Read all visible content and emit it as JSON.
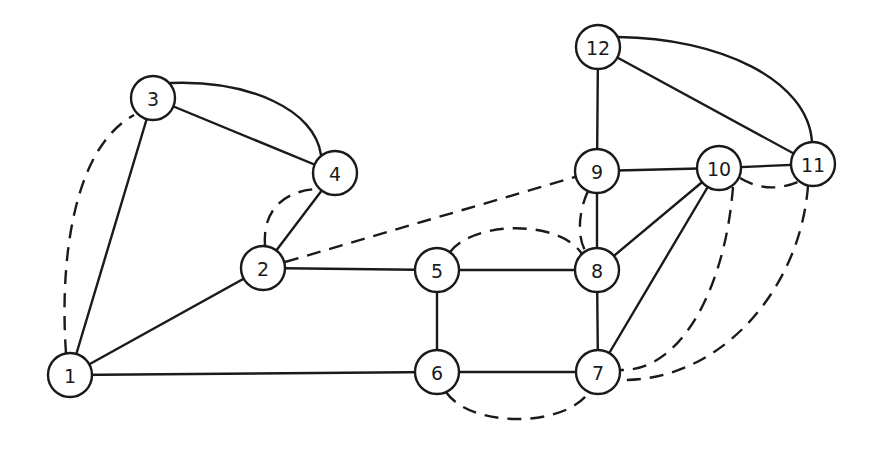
{
  "diagram": {
    "type": "undirected-graph",
    "colors": {
      "stroke": "#1a1a1a",
      "background": "#ffffff",
      "node_fill": "#ffffff"
    },
    "node_radius": 22,
    "nodes": [
      {
        "id": "1",
        "label": "1",
        "x": 70,
        "y": 375
      },
      {
        "id": "2",
        "label": "2",
        "x": 263,
        "y": 268
      },
      {
        "id": "3",
        "label": "3",
        "x": 153,
        "y": 98
      },
      {
        "id": "4",
        "label": "4",
        "x": 335,
        "y": 173
      },
      {
        "id": "5",
        "label": "5",
        "x": 437,
        "y": 270
      },
      {
        "id": "6",
        "label": "6",
        "x": 437,
        "y": 372
      },
      {
        "id": "7",
        "label": "7",
        "x": 598,
        "y": 372
      },
      {
        "id": "8",
        "label": "8",
        "x": 597,
        "y": 270
      },
      {
        "id": "9",
        "label": "9",
        "x": 597,
        "y": 171
      },
      {
        "id": "10",
        "label": "10",
        "x": 719,
        "y": 168
      },
      {
        "id": "11",
        "label": "11",
        "x": 813,
        "y": 164
      },
      {
        "id": "12",
        "label": "12",
        "x": 598,
        "y": 47
      }
    ],
    "edges": [
      {
        "from": "1",
        "to": "3",
        "style": "solid",
        "path": "M70,375 L153,98"
      },
      {
        "from": "1",
        "to": "2",
        "style": "solid",
        "path": "M70,375 L263,268"
      },
      {
        "from": "1",
        "to": "6",
        "style": "solid",
        "path": "M70,375 L437,372"
      },
      {
        "from": "3",
        "to": "4",
        "style": "solid",
        "path": "M153,98 L335,173"
      },
      {
        "from": "3",
        "to": "4",
        "style": "solid",
        "path": "M170,83 C250,80 315,110 321,155"
      },
      {
        "from": "2",
        "to": "4",
        "style": "solid",
        "path": "M263,268 L335,173"
      },
      {
        "from": "2",
        "to": "5",
        "style": "solid",
        "path": "M263,268 L437,270"
      },
      {
        "from": "5",
        "to": "8",
        "style": "solid",
        "path": "M437,270 L597,270"
      },
      {
        "from": "5",
        "to": "6",
        "style": "solid",
        "path": "M437,270 L437,372"
      },
      {
        "from": "6",
        "to": "7",
        "style": "solid",
        "path": "M437,372 L598,372"
      },
      {
        "from": "8",
        "to": "7",
        "style": "solid",
        "path": "M597,270 L598,372"
      },
      {
        "from": "9",
        "to": "8",
        "style": "solid",
        "path": "M597,171 L597,270"
      },
      {
        "from": "12",
        "to": "9",
        "style": "solid",
        "path": "M598,47 L597,171"
      },
      {
        "from": "9",
        "to": "10",
        "style": "solid",
        "path": "M597,171 L719,168"
      },
      {
        "from": "10",
        "to": "11",
        "style": "solid",
        "path": "M719,168 L813,164"
      },
      {
        "from": "12",
        "to": "11",
        "style": "solid",
        "path": "M598,47 L813,164"
      },
      {
        "from": "12",
        "to": "11",
        "style": "solid",
        "path": "M618,37 C720,38 808,80 812,142"
      },
      {
        "from": "10",
        "to": "8",
        "style": "solid",
        "path": "M719,168 L597,270"
      },
      {
        "from": "10",
        "to": "7",
        "style": "solid",
        "path": "M719,168 L598,372"
      },
      {
        "from": "1",
        "to": "3",
        "style": "dashed",
        "path": "M66,353 C60,270 70,150 134,115"
      },
      {
        "from": "2",
        "to": "4",
        "style": "dashed",
        "path": "M265,246 C262,205 290,190 318,189"
      },
      {
        "from": "2",
        "to": "9",
        "style": "dashed",
        "path": "M285,262 L575,177"
      },
      {
        "from": "5",
        "to": "8",
        "style": "dashed",
        "path": "M450,252 C475,220 560,220 582,254"
      },
      {
        "from": "9",
        "to": "8",
        "style": "dashed",
        "path": "M588,191 C577,215 578,240 586,252"
      },
      {
        "from": "6",
        "to": "7",
        "style": "dashed",
        "path": "M446,392 C470,428 565,428 589,392"
      },
      {
        "from": "10",
        "to": "11",
        "style": "dashed",
        "path": "M740,178 C760,190 780,190 800,181"
      },
      {
        "from": "10",
        "to": "7",
        "style": "dashed",
        "path": "M733,187 C725,290 680,372 620,370"
      },
      {
        "from": "11",
        "to": "7",
        "style": "dashed",
        "path": "M808,186 C800,290 720,382 620,380"
      }
    ]
  }
}
